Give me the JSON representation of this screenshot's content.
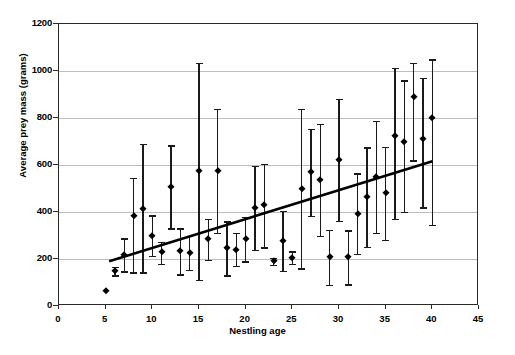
{
  "chart_data": {
    "type": "scatter",
    "title": "",
    "xlabel": "Nestling age",
    "ylabel": "Average prey mass (grams)",
    "xlim": [
      0,
      45
    ],
    "ylim": [
      0,
      1200
    ],
    "xticks": [
      0,
      5,
      10,
      15,
      20,
      25,
      30,
      35,
      40,
      45
    ],
    "yticks": [
      0,
      200,
      400,
      600,
      800,
      1000,
      1200
    ],
    "grid": "horizontal",
    "legend": "none",
    "marker": "filled-diamond",
    "errorbars": "vertical-with-caps",
    "series": [
      {
        "name": "Average prey mass",
        "points": [
          {
            "x": 5,
            "y": 62,
            "lo": 62,
            "hi": 62
          },
          {
            "x": 6,
            "y": 148,
            "lo": 131,
            "hi": 166
          },
          {
            "x": 7,
            "y": 218,
            "lo": 148,
            "hi": 288
          },
          {
            "x": 8,
            "y": 382,
            "lo": 143,
            "hi": 545
          },
          {
            "x": 9,
            "y": 414,
            "lo": 143,
            "hi": 690
          },
          {
            "x": 10,
            "y": 300,
            "lo": 212,
            "hi": 386
          },
          {
            "x": 11,
            "y": 228,
            "lo": 180,
            "hi": 274
          },
          {
            "x": 12,
            "y": 505,
            "lo": 330,
            "hi": 683
          },
          {
            "x": 13,
            "y": 233,
            "lo": 135,
            "hi": 330
          },
          {
            "x": 14,
            "y": 227,
            "lo": 155,
            "hi": 300
          },
          {
            "x": 15,
            "y": 574,
            "lo": 112,
            "hi": 1035
          },
          {
            "x": 16,
            "y": 284,
            "lo": 197,
            "hi": 372
          },
          {
            "x": 17,
            "y": 576,
            "lo": 312,
            "hi": 840
          },
          {
            "x": 18,
            "y": 245,
            "lo": 130,
            "hi": 360
          },
          {
            "x": 19,
            "y": 240,
            "lo": 172,
            "hi": 310
          },
          {
            "x": 20,
            "y": 285,
            "lo": 190,
            "hi": 380
          },
          {
            "x": 21,
            "y": 418,
            "lo": 240,
            "hi": 596
          },
          {
            "x": 22,
            "y": 428,
            "lo": 250,
            "hi": 605
          },
          {
            "x": 23,
            "y": 190,
            "lo": 175,
            "hi": 205
          },
          {
            "x": 24,
            "y": 278,
            "lo": 150,
            "hi": 405
          },
          {
            "x": 25,
            "y": 205,
            "lo": 178,
            "hi": 232
          },
          {
            "x": 26,
            "y": 500,
            "lo": 160,
            "hi": 840
          },
          {
            "x": 27,
            "y": 570,
            "lo": 385,
            "hi": 755
          },
          {
            "x": 28,
            "y": 537,
            "lo": 300,
            "hi": 775
          },
          {
            "x": 29,
            "y": 207,
            "lo": 90,
            "hi": 325
          },
          {
            "x": 30,
            "y": 622,
            "lo": 362,
            "hi": 880
          },
          {
            "x": 31,
            "y": 207,
            "lo": 92,
            "hi": 322
          },
          {
            "x": 32,
            "y": 393,
            "lo": 222,
            "hi": 565
          },
          {
            "x": 33,
            "y": 463,
            "lo": 252,
            "hi": 675
          },
          {
            "x": 34,
            "y": 548,
            "lo": 310,
            "hi": 787
          },
          {
            "x": 35,
            "y": 480,
            "lo": 282,
            "hi": 678
          },
          {
            "x": 36,
            "y": 722,
            "lo": 372,
            "hi": 1012
          },
          {
            "x": 37,
            "y": 700,
            "lo": 400,
            "hi": 960
          },
          {
            "x": 38,
            "y": 890,
            "lo": 620,
            "hi": 1035
          },
          {
            "x": 39,
            "y": 710,
            "lo": 420,
            "hi": 972
          },
          {
            "x": 40,
            "y": 800,
            "lo": 345,
            "hi": 1050
          }
        ]
      }
    ],
    "trendline": {
      "x0": 5.4,
      "y0": 183,
      "x1": 40.2,
      "y1": 612
    }
  },
  "colors": {
    "marker": "#000000",
    "errorbar": "#1a1a1a",
    "gridline": "#bdbdbd",
    "frame": "#2b2b2b",
    "trendline": "#000000",
    "background": "#ffffff"
  }
}
